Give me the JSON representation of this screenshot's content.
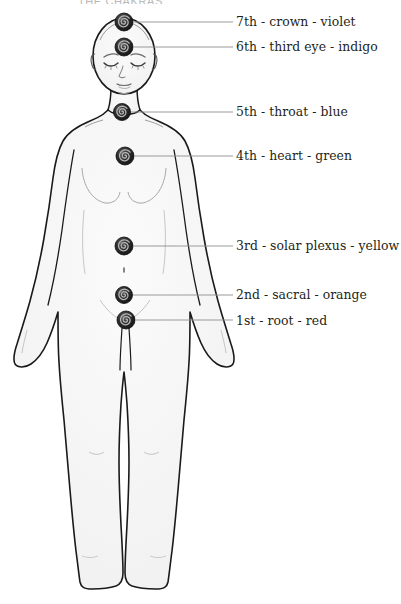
{
  "title": "THE CHAKRAS",
  "figure": {
    "name": "human-body-silhouette",
    "outline_color": "#1a1a1a",
    "fill_color": "#f7f7f7",
    "leader_line_color": "#8e8e8e"
  },
  "chakras": [
    {
      "id": "crown",
      "number": "7th",
      "label": "7th - crown - violet",
      "color_name": "violet",
      "color": "#8b2fc9",
      "marker": {
        "x": 124,
        "y": 22,
        "r": 9
      },
      "leader": {
        "x1": 134,
        "x2": 233,
        "y": 22
      },
      "label_y": 14
    },
    {
      "id": "third-eye",
      "number": "6th",
      "label": "6th - third eye - indigo",
      "color_name": "indigo",
      "color": "#3b3bb0",
      "marker": {
        "x": 124,
        "y": 47,
        "r": 9
      },
      "leader": {
        "x1": 134,
        "x2": 233,
        "y": 47
      },
      "label_y": 39
    },
    {
      "id": "throat",
      "number": "5th",
      "label": "5th - throat - blue",
      "color_name": "blue",
      "color": "#2b6fd0",
      "marker": {
        "x": 122,
        "y": 112,
        "r": 8.5
      },
      "leader": {
        "x1": 131,
        "x2": 233,
        "y": 112
      },
      "label_y": 104
    },
    {
      "id": "heart",
      "number": "4th",
      "label": "4th - heart - green",
      "color_name": "green",
      "color": "#2e9648",
      "marker": {
        "x": 125,
        "y": 156,
        "r": 9
      },
      "leader": {
        "x1": 135,
        "x2": 233,
        "y": 156
      },
      "label_y": 148
    },
    {
      "id": "solar-plexus",
      "number": "3rd",
      "label": "3rd - solar plexus - yellow",
      "color_name": "yellow",
      "color": "#e8c324",
      "marker": {
        "x": 124,
        "y": 246,
        "r": 9
      },
      "leader": {
        "x1": 134,
        "x2": 233,
        "y": 246
      },
      "label_y": 238
    },
    {
      "id": "sacral",
      "number": "2nd",
      "label": "2nd - sacral - orange",
      "color_name": "orange",
      "color": "#e8802a",
      "marker": {
        "x": 124,
        "y": 295,
        "r": 8.5
      },
      "leader": {
        "x1": 133,
        "x2": 233,
        "y": 295
      },
      "label_y": 287
    },
    {
      "id": "root",
      "number": "1st",
      "label": "1st - root - red",
      "color_name": "red",
      "color": "#cc2222",
      "marker": {
        "x": 126,
        "y": 320,
        "r": 9
      },
      "leader": {
        "x1": 136,
        "x2": 233,
        "y": 320
      },
      "label_y": 313
    }
  ]
}
